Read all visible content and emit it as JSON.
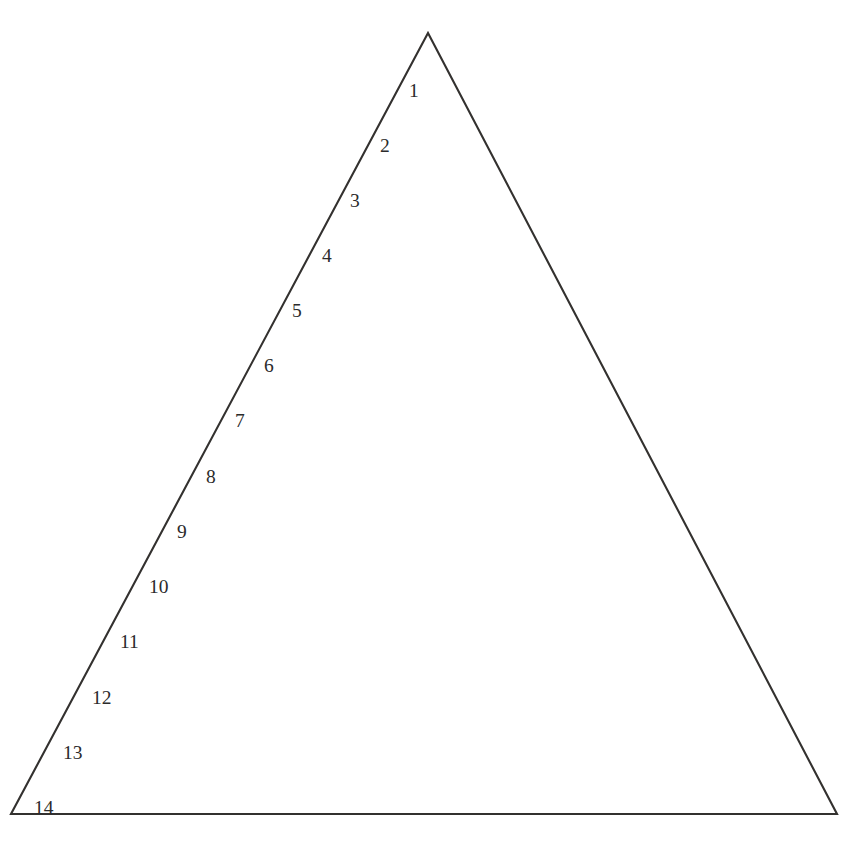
{
  "header": {
    "clipped_text": "-------  ------  ---- -------  --"
  },
  "figure": {
    "shape": "triangle",
    "apex_label": "1",
    "base_label": "14"
  },
  "chart_data": {
    "type": "pyramid",
    "title": "",
    "subtitle": "",
    "xlabel": "",
    "ylabel": "",
    "grid": false,
    "legend": null,
    "orientation": "apex-up",
    "tier_count": 14,
    "categories": [
      "1",
      "2",
      "3",
      "4",
      "5",
      "6",
      "7",
      "8",
      "9",
      "10",
      "11",
      "12",
      "13",
      "14"
    ],
    "values": [
      1,
      2,
      3,
      4,
      5,
      6,
      7,
      8,
      9,
      10,
      11,
      12,
      13,
      14
    ],
    "labels": [
      "1",
      "2",
      "3",
      "4",
      "5",
      "6",
      "7",
      "8",
      "9",
      "10",
      "11",
      "12",
      "13",
      "14"
    ],
    "geometry": {
      "apex_x": 428,
      "apex_y": 33,
      "base_left_x": 11,
      "base_right_x": 837,
      "base_y": 814,
      "divider_y_positions": [
        112,
        167,
        223,
        278,
        333,
        389,
        444,
        499,
        555,
        610,
        665,
        721,
        776
      ]
    },
    "colors": {
      "background": "#ffffff",
      "outline": "#33312f",
      "divider": "#6f6f6f",
      "label_text": "#2b2b2b"
    },
    "tiers": [
      {
        "number": "1",
        "label_x": 409,
        "label_y": 97
      },
      {
        "number": "2",
        "label_x": 380,
        "label_y": 152
      },
      {
        "number": "3",
        "label_x": 350,
        "label_y": 207
      },
      {
        "number": "4",
        "label_x": 322,
        "label_y": 262
      },
      {
        "number": "5",
        "label_x": 292,
        "label_y": 317
      },
      {
        "number": "6",
        "label_x": 264,
        "label_y": 372
      },
      {
        "number": "7",
        "label_x": 235,
        "label_y": 427
      },
      {
        "number": "8",
        "label_x": 206,
        "label_y": 483
      },
      {
        "number": "9",
        "label_x": 177,
        "label_y": 538
      },
      {
        "number": "10",
        "label_x": 149,
        "label_y": 593
      },
      {
        "number": "11",
        "label_x": 120,
        "label_y": 648
      },
      {
        "number": "12",
        "label_x": 92,
        "label_y": 704
      },
      {
        "number": "13",
        "label_x": 63,
        "label_y": 759
      },
      {
        "number": "14",
        "label_x": 34,
        "label_y": 814
      }
    ]
  }
}
